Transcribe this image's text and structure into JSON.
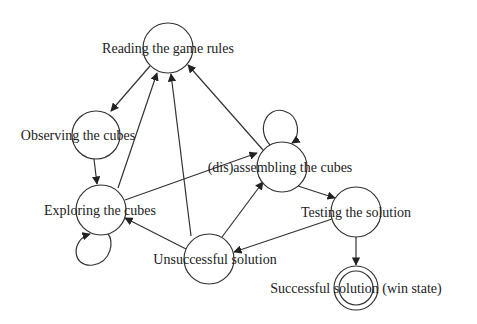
{
  "diagram": {
    "type": "state-transition",
    "nodes": [
      {
        "id": "reading",
        "label": "Reading the game rules",
        "cx": 168,
        "cy": 48,
        "r": 25,
        "lx": 168,
        "ly": 53,
        "final": false
      },
      {
        "id": "observing",
        "label": "Observing the cubes",
        "cx": 96,
        "cy": 135,
        "r": 24,
        "lx": 78,
        "ly": 140,
        "final": false
      },
      {
        "id": "exploring",
        "label": "Exploring the cubes",
        "cx": 101,
        "cy": 210,
        "r": 25,
        "lx": 100,
        "ly": 215,
        "final": false
      },
      {
        "id": "disassembling",
        "label": "(dis)assembling the cubes",
        "cx": 282,
        "cy": 167,
        "r": 25,
        "lx": 280,
        "ly": 172,
        "final": false
      },
      {
        "id": "testing",
        "label": "Testing the solution",
        "cx": 356,
        "cy": 212,
        "r": 25,
        "lx": 356,
        "ly": 217,
        "final": false
      },
      {
        "id": "unsuccessful",
        "label": "Unsuccessful solution",
        "cx": 209,
        "cy": 259,
        "r": 25,
        "lx": 215,
        "ly": 264,
        "final": false
      },
      {
        "id": "successful",
        "label": "Successful solution (win state)",
        "cx": 356,
        "cy": 288,
        "r": 22,
        "lx": 356,
        "ly": 293,
        "final": true
      }
    ],
    "edges": [
      {
        "from": "reading",
        "to": "observing"
      },
      {
        "from": "observing",
        "to": "exploring"
      },
      {
        "from": "exploring",
        "to": "reading"
      },
      {
        "from": "unsuccessful",
        "to": "reading"
      },
      {
        "from": "disassembling",
        "to": "reading"
      },
      {
        "from": "exploring",
        "to": "disassembling"
      },
      {
        "from": "unsuccessful",
        "to": "exploring"
      },
      {
        "from": "unsuccessful",
        "to": "disassembling"
      },
      {
        "from": "disassembling",
        "to": "testing"
      },
      {
        "from": "testing",
        "to": "unsuccessful"
      },
      {
        "from": "testing",
        "to": "successful"
      },
      {
        "from": "exploring",
        "to": "exploring",
        "self_loop": true
      },
      {
        "from": "disassembling",
        "to": "disassembling",
        "self_loop": true
      }
    ]
  },
  "labels": {
    "reading": "Reading the game rules",
    "observing": "Observing the cubes",
    "exploring": "Exploring the cubes",
    "disassembling": "(dis)assembling the cubes",
    "testing": "Testing the solution",
    "unsuccessful": "Unsuccessful solution",
    "successful": "Successful solution (win state)"
  }
}
